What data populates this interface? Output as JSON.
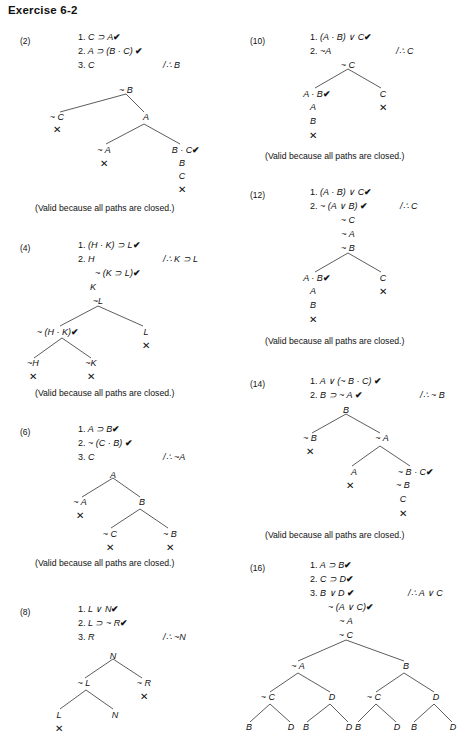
{
  "page": {
    "title": "Exercise 6-2",
    "closed_caption": "(Valid because all paths are closed.)",
    "check_mark": "✔",
    "close_mark": "✕"
  },
  "problems": [
    {
      "label": "(2)",
      "premises": [
        {
          "n": "1.",
          "text": "C ⊃ A",
          "check": true
        },
        {
          "n": "2.",
          "text": "A ⊃ (B · C)",
          "check": true
        },
        {
          "n": "3.",
          "text": "C",
          "check": false
        }
      ],
      "conclusion": "/∴ B",
      "stack_top": [
        "~ B"
      ],
      "tree_nodes": [
        "~ B",
        "~ C",
        "A",
        "~ A",
        "B · C",
        "B",
        "C"
      ],
      "closed": [
        "~ C",
        "~ A",
        "B · C path"
      ],
      "caption": "(Valid because all paths are closed.)"
    },
    {
      "label": "(4)",
      "premises": [
        {
          "n": "1.",
          "text": "(H · K) ⊃ L",
          "check": true
        },
        {
          "n": "2.",
          "text": "H",
          "check": false
        }
      ],
      "conclusion": "/∴ K ⊃ L",
      "stack_top": [
        "~ (K ⊃ L)",
        "K",
        "~L"
      ],
      "tree_nodes": [
        "~ (H · K)",
        "L",
        "~H",
        "~K"
      ],
      "caption": "(Valid because all paths are closed.)"
    },
    {
      "label": "(6)",
      "premises": [
        {
          "n": "1.",
          "text": "A ⊃ B",
          "check": true
        },
        {
          "n": "2.",
          "text": "~ (C · B)",
          "check": true
        },
        {
          "n": "3.",
          "text": "C",
          "check": false
        }
      ],
      "conclusion": "/∴ ~A",
      "stack_top": [
        "A"
      ],
      "tree_nodes": [
        "~ A",
        "B",
        "~ C",
        "~ B"
      ],
      "caption": "(Valid because all paths are closed.)"
    },
    {
      "label": "(8)",
      "premises": [
        {
          "n": "1.",
          "text": "L ∨ N",
          "check": true
        },
        {
          "n": "2.",
          "text": "L ⊃ ~ R",
          "check": true
        },
        {
          "n": "3.",
          "text": "R",
          "check": false
        }
      ],
      "conclusion": "/∴ ~N",
      "stack_top": [
        "N"
      ],
      "tree_nodes": [
        "~ L",
        "~ R",
        "L",
        "N"
      ],
      "caption": ""
    },
    {
      "label": "(10)",
      "premises": [
        {
          "n": "1.",
          "text": "(A · B) ∨ C",
          "check": true
        },
        {
          "n": "2.",
          "text": "~A",
          "check": false
        }
      ],
      "conclusion": "/∴ C",
      "stack_top": [
        "~ C"
      ],
      "tree_nodes": [
        "A · B",
        "C",
        "A",
        "B"
      ],
      "caption": "(Valid because all paths are closed.)"
    },
    {
      "label": "(12)",
      "premises": [
        {
          "n": "1.",
          "text": "(A · B) ∨ C",
          "check": true
        },
        {
          "n": "2.",
          "text": "~ (A ∨ B)",
          "check": true
        }
      ],
      "conclusion": "/∴ C",
      "stack_top": [
        "~ C",
        "~ A",
        "~ B"
      ],
      "tree_nodes": [
        "A · B",
        "C",
        "A",
        "B"
      ],
      "caption": "(Valid because all paths are closed.)"
    },
    {
      "label": "(14)",
      "premises": [
        {
          "n": "1.",
          "text": "A ∨ (~ B · C)",
          "check": true
        },
        {
          "n": "2.",
          "text": "B ⊃ ~ A",
          "check": true
        }
      ],
      "conclusion": "/∴ ~ B",
      "stack_top": [
        "B"
      ],
      "tree_nodes": [
        "~ B",
        "~ A",
        "A",
        "~ B · C",
        "~ B",
        "C"
      ],
      "caption": "(Valid because all paths are closed.)"
    },
    {
      "label": "(16)",
      "premises": [
        {
          "n": "1.",
          "text": "A ⊃ B",
          "check": true
        },
        {
          "n": "2.",
          "text": "C ⊃ D",
          "check": true
        },
        {
          "n": "3.",
          "text": "B ∨ D",
          "check": true
        }
      ],
      "conclusion": "/∴ A ∨ C",
      "stack_top": [
        "~ (A ∨ C)",
        "~ A",
        "~ C"
      ],
      "tree_nodes": [
        "~ A",
        "B",
        "~ C",
        "D",
        "~ C",
        "D",
        "B",
        "D",
        "B",
        "D",
        "B",
        "D",
        "B",
        "D"
      ],
      "caption": ""
    }
  ],
  "p2": {
    "label": "(2)",
    "l1n": "1.",
    "l1": "C ⊃ A",
    "l1c": "✔",
    "l2n": "2.",
    "l2": "A ⊃ (B · C)",
    "l2c": "✔",
    "l3n": "3.",
    "l3": "C",
    "concl": "/∴ B",
    "t_nB": "~ B",
    "t_nC": "~ C",
    "t_A": "A",
    "t_nA": "~ A",
    "t_BC": "B · C",
    "t_BCc": "✔",
    "t_B": "B",
    "t_C": "C",
    "x1": "✕",
    "x2": "✕",
    "x3": "✕",
    "cap": "(Valid because all paths are closed.)"
  },
  "p4": {
    "label": "(4)",
    "l1n": "1.",
    "l1": "(H · K) ⊃ L",
    "l1c": "✔",
    "l2n": "2.",
    "l2": "H",
    "concl": "/∴ K ⊃ L",
    "s1": "~ (K ⊃ L)",
    "s1c": "✔",
    "s2": "K",
    "s3": "~L",
    "t_nHK": "~ (H · K)",
    "t_nHKc": "✔",
    "t_L": "L",
    "t_nH": "~H",
    "t_nK": "~K",
    "x1": "✕",
    "x2": "✕",
    "x3": "✕",
    "cap": "(Valid because all paths are closed.)"
  },
  "p6": {
    "label": "(6)",
    "l1n": "1.",
    "l1": "A ⊃ B",
    "l1c": "✔",
    "l2n": "2.",
    "l2": "~ (C · B)",
    "l2c": "✔",
    "l3n": "3.",
    "l3": "C",
    "concl": "/∴ ~A",
    "t_A": "A",
    "t_nA": "~ A",
    "t_B": "B",
    "t_nC": "~ C",
    "t_nB": "~ B",
    "x1": "✕",
    "x2": "✕",
    "x3": "✕",
    "cap": "(Valid because all paths are closed.)"
  },
  "p8": {
    "label": "(8)",
    "l1n": "1.",
    "l1": "L ∨ N",
    "l1c": "✔",
    "l2n": "2.",
    "l2": "L ⊃ ~ R",
    "l2c": "✔",
    "l3n": "3.",
    "l3": "R",
    "concl": "/∴ ~N",
    "t_N": "N",
    "t_nL": "~ L",
    "t_nR": "~ R",
    "t_L": "L",
    "t_N2": "N",
    "x1": "✕",
    "x2": "✕"
  },
  "p10": {
    "label": "(10)",
    "l1n": "1.",
    "l1": "(A · B) ∨ C",
    "l1c": "✔",
    "l2n": "2.",
    "l2": "~A",
    "concl": "/∴ C",
    "s1": "~ C",
    "t_AB": "A · B",
    "t_ABc": "✔",
    "t_C": "C",
    "t_A": "A",
    "t_B": "B",
    "x1": "✕",
    "x2": "✕",
    "cap": "(Valid because all paths are closed.)"
  },
  "p12": {
    "label": "(12)",
    "l1n": "1.",
    "l1": "(A · B) ∨ C",
    "l1c": "✔",
    "l2n": "2.",
    "l2": "~ (A ∨ B)",
    "l2c": "✔",
    "concl": "/∴ C",
    "s1": "~ C",
    "s2": "~ A",
    "s3": "~ B",
    "t_AB": "A · B",
    "t_ABc": "✔",
    "t_C": "C",
    "t_A": "A",
    "t_B": "B",
    "x1": "✕",
    "x2": "✕",
    "cap": "(Valid because all paths are closed.)"
  },
  "p14": {
    "label": "(14)",
    "l1n": "1.",
    "l1": "A ∨ (~ B · C)",
    "l1c": "✔",
    "l2n": "2.",
    "l2": "B ⊃ ~ A",
    "l2c": "✔",
    "concl": "/∴ ~ B",
    "s1": "B",
    "t_nB": "~ B",
    "t_nA": "~ A",
    "t_A": "A",
    "t_nBC": "~ B · C",
    "t_nBCc": "✔",
    "t_nB2": "~ B",
    "t_C": "C",
    "x1": "✕",
    "x2": "✕",
    "x3": "✕",
    "cap": "(Valid because all paths are closed.)"
  },
  "p16": {
    "label": "(16)",
    "l1n": "1.",
    "l1": "A ⊃ B",
    "l1c": "✔",
    "l2n": "2.",
    "l2": "C ⊃ D",
    "l2c": "✔",
    "l3n": "3.",
    "l3": "B ∨ D",
    "l3c": "✔",
    "concl": "/∴ A ∨ C",
    "s1": "~ (A ∨ C)",
    "s1c": "✔",
    "s2": "~ A",
    "s3": "~ C",
    "n_nA": "~ A",
    "n_B": "B",
    "n_nC1": "~ C",
    "n_D1": "D",
    "n_nC2": "~ C",
    "n_D2": "D",
    "b1": "B",
    "d1": "D",
    "b2": "B",
    "d2": "D",
    "b3": "B",
    "d3": "D",
    "b4": "B",
    "d4": "D"
  }
}
